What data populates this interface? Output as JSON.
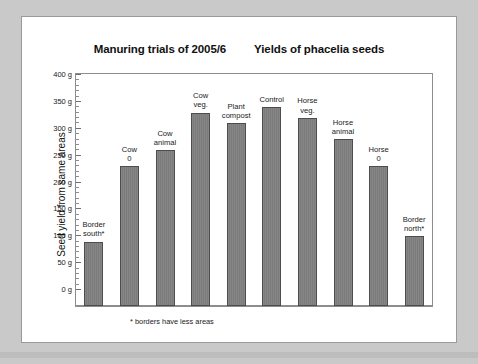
{
  "titles": {
    "left": "Manuring trials of 2005/6",
    "right": "Yields of phacelia seeds"
  },
  "footnote": "* borders have less areas",
  "axis": {
    "ylabel": "Seed yield from same areas",
    "unit": "g",
    "ticks": [
      "0 g",
      "50 g",
      "100 g",
      "150 g",
      "200 g",
      "250 g",
      "300 g",
      "350 g",
      "400 g"
    ]
  },
  "colors": {
    "bar_fill": "#808080",
    "bar_stroke": "#4d4d4d",
    "frame": "#8d8d8d",
    "page_background": "#c9c9c9",
    "card_background": "#ffffff",
    "text": "#1a1a1a"
  },
  "chart_data": {
    "type": "bar",
    "title": "Manuring trials of 2005/6   Yields of phacelia seeds",
    "xlabel": "",
    "ylabel": "Seed yield from same areas",
    "ylim": [
      0,
      400
    ],
    "ytick_step": 50,
    "yminor_step": 10,
    "grid": false,
    "legend": null,
    "annotations": [
      "* borders have less areas"
    ],
    "categories": [
      "Border south*",
      "Cow 0",
      "Cow animal",
      "Cow veg.",
      "Plant compost",
      "Control",
      "Horse veg.",
      "Horse animal",
      "Horse 0",
      "Border north*"
    ],
    "category_lines": [
      [
        "Border",
        "south*"
      ],
      [
        "Cow",
        "0"
      ],
      [
        "Cow",
        "animal"
      ],
      [
        "Cow",
        "veg."
      ],
      [
        "Plant",
        "compost"
      ],
      [
        "Control"
      ],
      [
        "Horse",
        "veg."
      ],
      [
        "Horse",
        "animal"
      ],
      [
        "Horse",
        "0"
      ],
      [
        "Border",
        "north*"
      ]
    ],
    "values": [
      120,
      260,
      290,
      360,
      340,
      370,
      350,
      310,
      260,
      130
    ],
    "units": "g"
  }
}
